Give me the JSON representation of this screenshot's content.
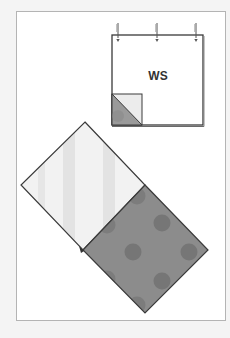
{
  "figure": {
    "type": "quilting-instruction-diagram",
    "square_label": "WS",
    "colors": {
      "page_background": "#f4f4f4",
      "frame_fill": "#ffffff",
      "frame_border": "#b4b4b4",
      "outline": "#3a3a3a",
      "light_fabric": "#f2f2f2",
      "light_fabric_stripe": "#e3e3e3",
      "dark_fabric": "#8c8c8c",
      "dark_fabric_dot": "#767676",
      "fold_light": "#ececec",
      "fold_dark": "#9a9a9a"
    },
    "top_square": {
      "description": "wrong-side-up square with pins along top edge and folded corner",
      "pin_count": 3,
      "folded_corner": "bottom-left"
    },
    "bottom_assembly": {
      "description": "two squares on point, joined at edge",
      "light_square": "striped",
      "dark_square": "polka-dot"
    }
  }
}
